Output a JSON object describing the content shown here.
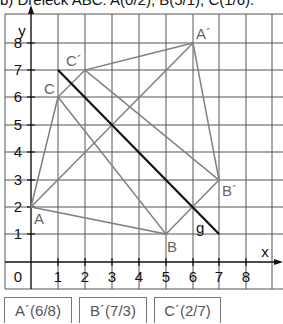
{
  "header": {
    "text": "b) Dreieck ABC: A(0/2), B(5/1), C(1/6)."
  },
  "axes": {
    "x_label": "x",
    "y_label": "y",
    "x_ticks": [
      "1",
      "2",
      "3",
      "4",
      "5",
      "6",
      "7",
      "8"
    ],
    "y_ticks": [
      "1",
      "2",
      "3",
      "4",
      "5",
      "6",
      "7",
      "8"
    ],
    "origin_label": "0"
  },
  "points": {
    "A": {
      "label": "A",
      "x": 0,
      "y": 2
    },
    "B": {
      "label": "B",
      "x": 5,
      "y": 1
    },
    "C": {
      "label": "C",
      "x": 1,
      "y": 6
    },
    "A_prime": {
      "label": "A´",
      "x": 6,
      "y": 8
    },
    "B_prime": {
      "label": "B´",
      "x": 7,
      "y": 3
    },
    "C_prime": {
      "label": "C´",
      "x": 2,
      "y": 7
    }
  },
  "mirror_line": {
    "label": "g",
    "from": [
      1,
      7
    ],
    "to": [
      7,
      1
    ]
  },
  "answers": [
    {
      "label": "A´(6/8)"
    },
    {
      "label": "B´(7/3)"
    },
    {
      "label": "C´(2/7)"
    }
  ],
  "colors": {
    "grid": "#555555",
    "triangle": "#808080",
    "mirror_line": "#111111",
    "labels": "#666666"
  }
}
